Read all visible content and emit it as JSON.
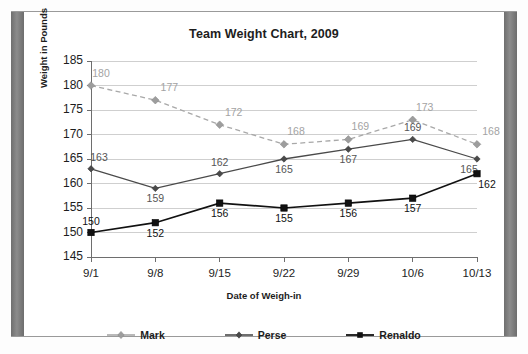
{
  "chart_data": {
    "type": "line",
    "title": "Team Weight Chart, 2009",
    "xlabel": "Date of Weigh-in",
    "ylabel": "Weight in Pounds",
    "categories": [
      "9/1",
      "9/8",
      "9/15",
      "9/22",
      "9/29",
      "10/6",
      "10/13"
    ],
    "ylim": [
      145,
      185
    ],
    "yticks": [
      145,
      150,
      155,
      160,
      165,
      170,
      175,
      180,
      185
    ],
    "grid": true,
    "legend_position": "bottom",
    "series": [
      {
        "name": "Mark",
        "color": "#a8a8a8",
        "marker": "diamond",
        "linestyle": "dashed",
        "values": [
          180,
          177,
          172,
          168,
          169,
          173,
          168
        ]
      },
      {
        "name": "Perse",
        "color": "#4a4a4a",
        "marker": "diamond",
        "linestyle": "solid",
        "values": [
          163,
          159,
          162,
          165,
          167,
          169,
          165
        ]
      },
      {
        "name": "Renaldo",
        "color": "#111111",
        "marker": "square",
        "linestyle": "solid",
        "values": [
          150,
          152,
          156,
          155,
          156,
          157,
          162
        ]
      }
    ],
    "data_labels": {
      "Mark": [
        "180",
        "177",
        "172",
        "168",
        "169",
        "173",
        "168"
      ],
      "Perse": [
        "163",
        "159",
        "162",
        "165",
        "167",
        "169",
        "165"
      ],
      "Renaldo": [
        "150",
        "152",
        "156",
        "155",
        "156",
        "157",
        "162"
      ]
    }
  },
  "legend": {
    "items": [
      {
        "label": "Mark"
      },
      {
        "label": "Perse"
      },
      {
        "label": "Renaldo"
      }
    ]
  }
}
